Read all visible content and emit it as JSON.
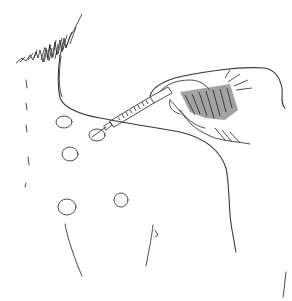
{
  "image": {
    "subject": "Line illustration of an injection into the upper back / shoulder region with a syringe held in a hand",
    "style": "black ink line art on white",
    "background": "#ffffff",
    "ink_color": "#3a3a3a"
  },
  "figure": {
    "injection_sites": [
      {
        "cx": 64,
        "cy": 122,
        "rx": 8,
        "ry": 6
      },
      {
        "cx": 97,
        "cy": 135,
        "rx": 8,
        "ry": 6
      },
      {
        "cx": 70,
        "cy": 154,
        "rx": 8,
        "ry": 7
      },
      {
        "cx": 67,
        "cy": 207,
        "rx": 9,
        "ry": 8
      },
      {
        "cx": 121,
        "cy": 200,
        "rx": 7,
        "ry": 7
      }
    ],
    "syringe": {
      "needle_tip": [
        93,
        137
      ],
      "barrel_end": [
        185,
        92
      ]
    }
  }
}
